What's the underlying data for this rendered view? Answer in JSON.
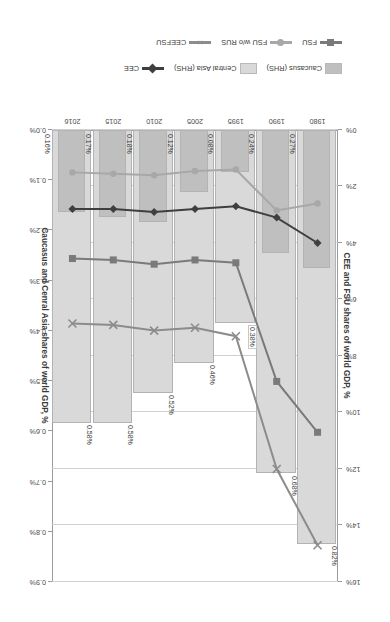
{
  "axis_titles": {
    "left": "CEE and FSU shares of world GDP, %",
    "right": "Caucasus and Cenral Asia shares of world GDP, %"
  },
  "legend": {
    "row1": [
      {
        "label": "Caucasus (RHS)",
        "type": "bar",
        "color": "#bfbfbf"
      },
      {
        "label": "Central Asia (RHS)",
        "type": "bar",
        "color": "#d9d9d9"
      },
      {
        "label": "CEE",
        "type": "line",
        "color": "#3f3f3f",
        "marker": "diamond"
      }
    ],
    "row2": [
      {
        "label": "FSU",
        "type": "line",
        "color": "#7a7a7a",
        "marker": "square"
      },
      {
        "label": "FSU w/o RUS",
        "type": "line",
        "color": "#a8a8a8",
        "marker": "circle"
      },
      {
        "label": "CEEFSU",
        "type": "line",
        "color": "#8c8c8c",
        "marker": "cross"
      }
    ]
  },
  "chart_data": {
    "type": "bar",
    "title": "",
    "categories": [
      "1980",
      "1990",
      "1995",
      "2005",
      "2010",
      "2015",
      "2016"
    ],
    "xlabel": "",
    "ylabel": "CEE and FSU shares of world GDP, %",
    "y2label": "Caucasus and Cenral Asia shares of world GDP, %",
    "ylim": [
      0,
      16
    ],
    "y2lim": [
      0,
      0.9
    ],
    "yticks": [
      "0%",
      "2%",
      "4%",
      "6%",
      "8%",
      "10%",
      "12%",
      "14%",
      "16%"
    ],
    "y2ticks": [
      "0.0%",
      "0.1%",
      "0.2%",
      "0.3%",
      "0.4%",
      "0.5%",
      "0.6%",
      "0.7%",
      "0.8%",
      "0.9%"
    ],
    "grid": true,
    "legend_position": "bottom",
    "series": [
      {
        "name": "Caucasus (RHS)",
        "type": "bar",
        "axis": "right",
        "color": "#bfbfbf",
        "values": [
          0.27,
          0.24,
          0.08,
          0.12,
          0.18,
          0.17,
          0.16
        ],
        "labels": [
          "0.27%",
          "0.24%",
          "0.08%",
          "0.12%",
          "0.18%",
          "0.17%",
          "0.16%"
        ]
      },
      {
        "name": "Central Asia (RHS)",
        "type": "bar",
        "axis": "right",
        "color": "#d9d9d9",
        "values": [
          0.82,
          0.68,
          0.38,
          0.46,
          0.52,
          0.58,
          0.58
        ],
        "labels": [
          "0.82%",
          "0.68%",
          "0.38%",
          "0.46%",
          "0.52%",
          "0.58%",
          "0.58%"
        ]
      },
      {
        "name": "CEE",
        "type": "line",
        "axis": "left",
        "color": "#3f3f3f",
        "marker": "diamond",
        "values": [
          4.0,
          3.1,
          2.7,
          2.8,
          2.9,
          2.8,
          2.8
        ]
      },
      {
        "name": "FSU",
        "type": "line",
        "axis": "left",
        "color": "#7a7a7a",
        "marker": "square",
        "values": [
          10.7,
          8.9,
          4.7,
          4.6,
          4.75,
          4.6,
          4.55
        ]
      },
      {
        "name": "FSU w/o RUS",
        "type": "line",
        "axis": "left",
        "color": "#a8a8a8",
        "marker": "circle",
        "values": [
          2.6,
          2.85,
          1.4,
          1.45,
          1.6,
          1.55,
          1.5
        ]
      },
      {
        "name": "CEEFSU",
        "type": "line",
        "axis": "left",
        "color": "#8c8c8c",
        "marker": "cross",
        "values": [
          14.7,
          12.0,
          7.3,
          7.0,
          7.1,
          6.9,
          6.85
        ]
      }
    ]
  }
}
